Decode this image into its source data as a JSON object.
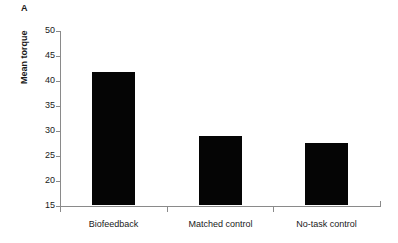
{
  "figure": {
    "panel_label": "A"
  },
  "chart_data": {
    "type": "bar",
    "title": "",
    "subtitle": "",
    "xlabel": "",
    "ylabel": "Mean torque",
    "categories": [
      "Biofeedback",
      "Matched control",
      "No-task control"
    ],
    "values": [
      41.6,
      28.8,
      27.4
    ],
    "series": [
      {
        "name": "Mean torque",
        "values": [
          41.6,
          28.8,
          27.4
        ]
      }
    ],
    "ylim": [
      15,
      50
    ],
    "ytick_labels": [
      "50",
      "45",
      "40",
      "35",
      "30",
      "25",
      "20",
      "15"
    ],
    "ytick_values": [
      50,
      45,
      40,
      35,
      30,
      25,
      20,
      15
    ],
    "ytick_step": 5,
    "grid": false,
    "legend": false,
    "legend_position": "none",
    "bar_color": "#050505",
    "axis_color": "#8a8a8a",
    "background_color": "#ffffff",
    "annotations": [
      "A"
    ]
  }
}
